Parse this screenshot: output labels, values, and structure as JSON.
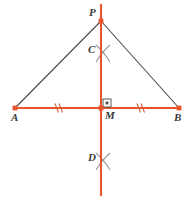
{
  "diagram": {
    "colors": {
      "construction_line": "#E8542B",
      "triangle_leg": "#4A4A4A",
      "label_text": "#3A3A3A",
      "arc_mark": "#8A8A8A",
      "background": "#FFFFFF"
    },
    "points": [
      {
        "id": "P",
        "label": "P",
        "x": 101,
        "y": 21,
        "label_x": 89,
        "label_y": 12,
        "marker": "square"
      },
      {
        "id": "C",
        "label": "C",
        "x": 101,
        "y": 54,
        "label_x": 88,
        "label_y": 48,
        "marker": "none"
      },
      {
        "id": "A",
        "label": "A",
        "x": 15,
        "y": 108,
        "label_x": 11,
        "label_y": 114,
        "marker": "square"
      },
      {
        "id": "M",
        "label": "M",
        "x": 101,
        "y": 108,
        "label_x": 104,
        "label_y": 111,
        "marker": "square"
      },
      {
        "id": "B",
        "label": "B",
        "x": 179,
        "y": 108,
        "label_x": 175,
        "label_y": 114,
        "marker": "square"
      },
      {
        "id": "D",
        "label": "D",
        "x": 101,
        "y": 162,
        "label_x": 88,
        "label_y": 156,
        "marker": "none"
      }
    ],
    "segments": [
      {
        "id": "line-AB",
        "name": "segment-ab",
        "from": "A",
        "to": "B",
        "kind": "construction"
      },
      {
        "id": "line-vertical",
        "name": "perpendicular-bisector",
        "from": "top",
        "to": "bottom",
        "kind": "construction"
      },
      {
        "id": "leg-PA",
        "name": "triangle-leg-pa",
        "from": "P",
        "to": "A",
        "kind": "leg"
      },
      {
        "id": "leg-PB",
        "name": "triangle-leg-pb",
        "from": "P",
        "to": "B",
        "kind": "leg"
      }
    ],
    "tick_marks": [
      {
        "id": "tick-AM",
        "name": "congruence-tick-am",
        "x": 58,
        "y": 108,
        "count": 2
      },
      {
        "id": "tick-MB",
        "name": "congruence-tick-mb",
        "x": 140,
        "y": 108,
        "count": 2
      }
    ],
    "right_angle": {
      "id": "right-angle-M",
      "name": "right-angle-mark",
      "x": 103,
      "y": 99,
      "size": 8,
      "has_dot": true
    },
    "arc_crossings": [
      {
        "id": "arc-C",
        "name": "arc-intersection-c",
        "cx": 103,
        "cy": 54
      },
      {
        "id": "arc-D",
        "name": "arc-intersection-d",
        "cx": 103,
        "cy": 162
      }
    ],
    "vertical_line": {
      "x": 101,
      "y_top": 4,
      "y_bottom": 196
    },
    "horizontal_line": {
      "y": 108,
      "x_left": 15,
      "x_right": 179
    }
  }
}
